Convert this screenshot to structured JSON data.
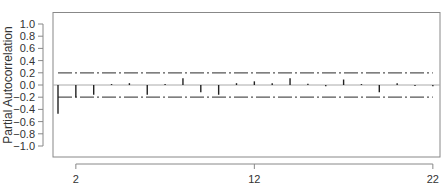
{
  "chart_data": {
    "type": "bar",
    "subtype": "pacf-spike",
    "title": "",
    "xlabel": "",
    "ylabel": "Partial Autocorrelation",
    "x": [
      1,
      2,
      3,
      4,
      5,
      6,
      7,
      8,
      9,
      10,
      11,
      12,
      13,
      14,
      15,
      16,
      17,
      18,
      19,
      20,
      21,
      22
    ],
    "values": [
      -0.47,
      -0.2,
      -0.16,
      0.0,
      0.03,
      -0.16,
      0.01,
      0.11,
      -0.12,
      -0.16,
      0.03,
      0.06,
      0.03,
      0.11,
      0.02,
      -0.02,
      0.09,
      0.0,
      -0.12,
      0.03,
      -0.01,
      -0.02
    ],
    "confidence_band": {
      "upper": 0.2,
      "lower": -0.2,
      "style": "dash-dot"
    },
    "ylim": [
      -1.0,
      1.0
    ],
    "xlim": [
      1,
      22
    ],
    "y_ticks": [
      "1.0",
      "0.8",
      "0.6",
      "0.4",
      "0.2",
      "0.0",
      "-0.2",
      "-0.4",
      "-0.6",
      "-0.8",
      "-1.0"
    ],
    "y_tick_values": [
      1.0,
      0.8,
      0.6,
      0.4,
      0.2,
      0.0,
      -0.2,
      -0.4,
      -0.6,
      -0.8,
      -1.0
    ],
    "x_ticks": [
      "2",
      "12",
      "22"
    ],
    "x_tick_values": [
      2,
      12,
      22
    ],
    "grid": false,
    "legend": null,
    "colors": {
      "spike": "#222222",
      "band": "#555555",
      "zero_line": "#aaaaaa",
      "frame": "#888888"
    }
  }
}
